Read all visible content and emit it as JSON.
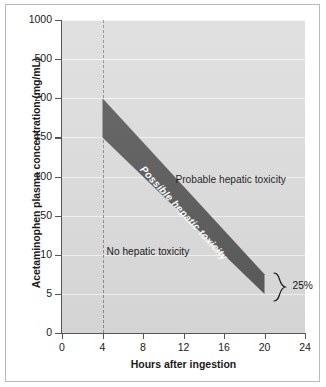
{
  "chart_data": {
    "type": "area",
    "title": "",
    "subtitle": "",
    "xlabel": "Hours after ingestion",
    "ylabel": "Acetaminophen plasma concentration (mg/mL)",
    "xlim": [
      0,
      24
    ],
    "ylim_labels": [
      "0",
      "5",
      "10",
      "50",
      "100",
      "150",
      "200",
      "500",
      "1000"
    ],
    "x_ticks": [
      0,
      4,
      8,
      12,
      16,
      20,
      24
    ],
    "x_tick_labels": [
      "0",
      "4",
      "8",
      "12",
      "16",
      "20",
      "24"
    ],
    "y_ticks": [
      0,
      5,
      10,
      50,
      100,
      150,
      200,
      500,
      1000
    ],
    "y_tick_labels": [
      "0",
      "5",
      "10",
      "50",
      "100",
      "150",
      "200",
      "500",
      "1000"
    ],
    "grid": true,
    "grid_orientation": "horizontal",
    "plot_background": "#dcdcdc",
    "band_color": "#595959",
    "series": [
      {
        "name": "Probable hepatic toxicity line (upper boundary)",
        "x": [
          4,
          20
        ],
        "y": [
          200,
          7.5
        ]
      },
      {
        "name": "Possible hepatic toxicity line (lower boundary)",
        "x": [
          4,
          20
        ],
        "y": [
          150,
          5
        ]
      }
    ],
    "reference_lines": [
      {
        "name": "four-hour-marker",
        "orientation": "vertical",
        "x": 4,
        "style": "dashed",
        "color": "#8c8c8c"
      }
    ],
    "annotations": [
      {
        "name": "probable-region-label",
        "text": "Probable hepatic toxicity",
        "region": "above-band"
      },
      {
        "name": "possible-region-label",
        "text": "Possible hepatic toxicity",
        "region": "inside-band",
        "rotated": true
      },
      {
        "name": "no-toxicity-region-label",
        "text": "No hepatic toxicity",
        "region": "below-band"
      },
      {
        "name": "band-width-brace-label",
        "text": "25%",
        "region": "right-of-band-end"
      }
    ]
  },
  "axes": {
    "y_title": "Acetaminophen plasma concentration (mg/mL)",
    "x_title": "Hours after ingestion"
  },
  "labels": {
    "probable": "Probable hepatic toxicity",
    "possible": "Possible hepatic toxicity",
    "none": "No hepatic toxicity",
    "brace_percent": "25%"
  }
}
